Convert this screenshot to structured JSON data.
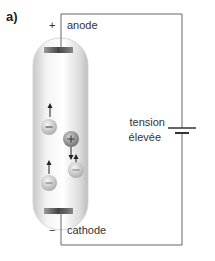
{
  "figure": {
    "panel_label": "a)",
    "anode": {
      "sign": "+",
      "label": "anode"
    },
    "cathode": {
      "sign": "−",
      "label": "cathode"
    },
    "source": {
      "line1": "tension",
      "line2": "élevée"
    },
    "particles": [
      {
        "charge": "−",
        "direction": "up"
      },
      {
        "charge": "+",
        "direction": "down"
      },
      {
        "charge": "−",
        "direction": "up"
      },
      {
        "charge": "−",
        "direction": "up"
      }
    ],
    "colors": {
      "wire": "#666666",
      "tube_fill": "#e6e6e6",
      "electrode": "#555555",
      "particle": "#cfcfcf",
      "particle_positive": "#9a9a9a"
    }
  }
}
